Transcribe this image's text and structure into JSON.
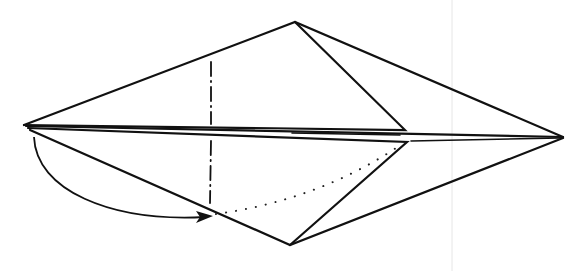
{
  "diagram": {
    "title": "",
    "type": "origami-folding-step",
    "colors": {
      "line": "#111111",
      "background": "#ffffff"
    },
    "vertices": {
      "left_tip": [
        24,
        125
      ],
      "top": [
        295,
        22
      ],
      "right_tip": [
        563,
        137
      ],
      "bottom": [
        290,
        245
      ],
      "upper_flap_tip": [
        405,
        130
      ],
      "lower_flap_tip": [
        407,
        142
      ]
    },
    "fold_lines": [
      {
        "kind": "mountain-fold",
        "from": [
          211,
          62
        ],
        "to": [
          211,
          124
        ]
      },
      {
        "kind": "mountain-fold",
        "from": [
          211,
          139
        ],
        "to": [
          210,
          203
        ]
      }
    ],
    "hidden_lines": [
      {
        "kind": "dotted-curve",
        "from": [
          216,
          214
        ],
        "to": [
          402,
          144
        ]
      }
    ],
    "arrows": [
      {
        "kind": "fold-behind",
        "from": [
          34,
          137
        ],
        "to": [
          212,
          217
        ]
      }
    ]
  }
}
